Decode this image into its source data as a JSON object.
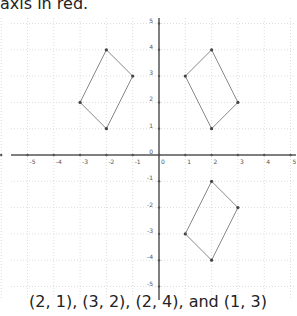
{
  "header": {
    "text": "axis in red."
  },
  "caption": {
    "text": "(2, 1), (3, 2), (2, 4), and (1, 3)"
  },
  "chart_data": {
    "type": "scatter",
    "title": "",
    "xlabel": "",
    "ylabel": "",
    "xlim": [
      -6,
      5
    ],
    "ylim": [
      -5,
      5
    ],
    "grid": true,
    "x_ticks": [
      -6,
      -5,
      -4,
      -3,
      -2,
      -1,
      0,
      1,
      2,
      3,
      4,
      5
    ],
    "y_ticks": [
      -5,
      -4,
      -3,
      -2,
      -1,
      0,
      1,
      2,
      3,
      4,
      5
    ],
    "series": [
      {
        "name": "left-quadrilateral",
        "points": [
          [
            -2,
            4
          ],
          [
            -1,
            3
          ],
          [
            -2,
            1
          ],
          [
            -3,
            2
          ]
        ]
      },
      {
        "name": "upper-right-quadrilateral",
        "points": [
          [
            2,
            4
          ],
          [
            3,
            2
          ],
          [
            2,
            1
          ],
          [
            1,
            3
          ]
        ]
      },
      {
        "name": "lower-right-quadrilateral",
        "points": [
          [
            2,
            -1
          ],
          [
            3,
            -2
          ],
          [
            2,
            -4
          ],
          [
            1,
            -3
          ]
        ]
      }
    ]
  },
  "colors": {
    "shape_stroke": "#888888",
    "axis": "#555555",
    "grid": "#dddddd",
    "vertex": "#444444"
  }
}
